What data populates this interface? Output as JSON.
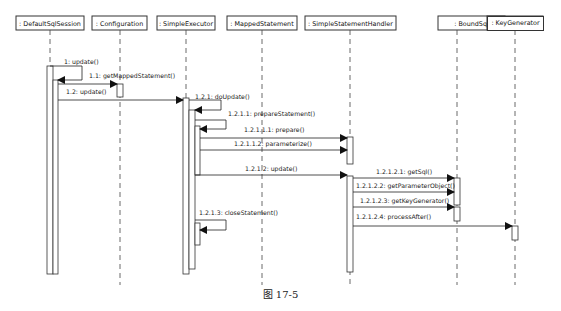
{
  "diagram": {
    "type": "sequence",
    "colors": {
      "line": "#333333",
      "background": "#ffffff",
      "box_fill": "#ffffff"
    },
    "participants": [
      {
        "id": "p0",
        "label": ": DefaultSqlSession",
        "x": 10,
        "w": 73,
        "cx": 51
      },
      {
        "id": "p1",
        "label": ": Configuration",
        "x": 91,
        "w": 61,
        "cx": 120
      },
      {
        "id": "p2",
        "label": ": SimpleExecutor",
        "x": 157,
        "w": 60,
        "cx": 187
      },
      {
        "id": "p3",
        "label": ": MappedStatement",
        "x": 225,
        "w": 73,
        "cx": 262
      },
      {
        "id": "p4",
        "label": ": SimpleStatementHandler",
        "x": 305,
        "w": 90,
        "cx": 350
      },
      {
        "id": "p5",
        "label": ": BoundSql",
        "x": 437,
        "w": 69,
        "cx": 457
      },
      {
        "id": "p6",
        "label": ": KeyGenerator",
        "x": 513,
        "w": 58,
        "cx": 515
      }
    ],
    "messages": [
      {
        "seq": "1",
        "label": "1: update()",
        "from": "p0",
        "to": "p0",
        "self": true
      },
      {
        "seq": "1.1",
        "label": "1.1: getMappedStatement()",
        "from": "p0",
        "to": "p1"
      },
      {
        "seq": "1.2",
        "label": "1.2: update()",
        "from": "p0",
        "to": "p2"
      },
      {
        "seq": "1.2.1",
        "label": "1.2.1: doUpdate()",
        "from": "p2",
        "to": "p2",
        "self": true
      },
      {
        "seq": "1.2.1.1",
        "label": "1.2.1.1: prepareStatement()",
        "from": "p2",
        "to": "p2",
        "self": true
      },
      {
        "seq": "1.2.1.1.1",
        "label": "1.2.1.1.1: prepare()",
        "from": "p2",
        "to": "p4"
      },
      {
        "seq": "1.2.1.1.2",
        "label": "1.2.1.1.2: parameterize()",
        "from": "p2",
        "to": "p4"
      },
      {
        "seq": "1.2.1.2",
        "label": "1.2.1.2: update()",
        "from": "p2",
        "to": "p4"
      },
      {
        "seq": "1.2.1.2.1",
        "label": "1.2.1.2.1: getSql()",
        "from": "p4",
        "to": "p5"
      },
      {
        "seq": "1.2.1.2.2",
        "label": "1.2.1.2.2: getParameterObject()",
        "from": "p4",
        "to": "p5"
      },
      {
        "seq": "1.2.1.2.3",
        "label": "1.2.1.2.3: getKeyGenerator()",
        "from": "p4",
        "to": "p5"
      },
      {
        "seq": "1.2.1.2.4",
        "label": "1.2.1.2.4: processAfter()",
        "from": "p4",
        "to": "p6"
      },
      {
        "seq": "1.2.1.3",
        "label": "1.2.1.3: closeStatement()",
        "from": "p2",
        "to": "p2",
        "self": true
      }
    ]
  },
  "caption": "图 17-5"
}
